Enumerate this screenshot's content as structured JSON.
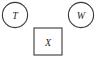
{
  "canvas": {
    "width": 98,
    "height": 59,
    "background_color": "#ffffff",
    "stroke_color": "#3a3a3a",
    "label_color": "#2b2b2b"
  },
  "diagram": {
    "type": "node-diagram",
    "connectors": [],
    "nodes": [
      {
        "id": "node-t",
        "label": "T",
        "shape": "circle",
        "cx": 15,
        "cy": 15,
        "r": 12.6
      },
      {
        "id": "node-w",
        "label": "W",
        "shape": "circle",
        "cx": 81,
        "cy": 15,
        "r": 12.6
      },
      {
        "id": "node-x",
        "label": "X",
        "shape": "square",
        "x": 34,
        "y": 28,
        "width": 28,
        "height": 27
      }
    ]
  }
}
